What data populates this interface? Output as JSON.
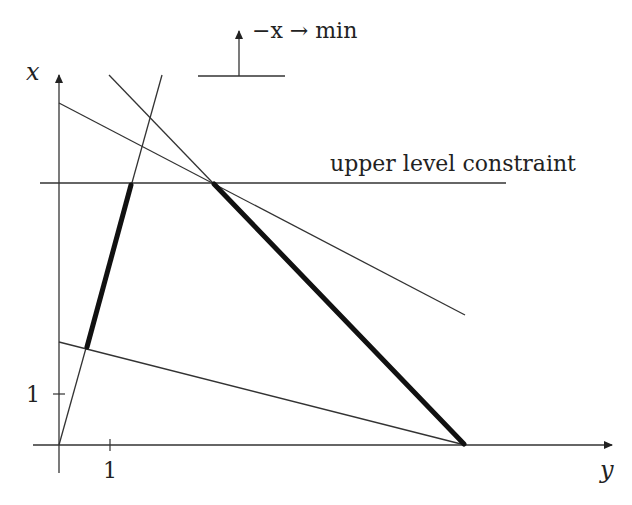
{
  "diagram": {
    "axes": {
      "x_axis_label": "y",
      "y_axis_label": "x",
      "tick_x_label": "1",
      "tick_y_label": "1"
    },
    "objective_label": "−x → min",
    "constraint_label": "upper level constraint",
    "colors": {
      "line": "#333333",
      "bold_line": "#111111",
      "background": "#ffffff"
    }
  }
}
